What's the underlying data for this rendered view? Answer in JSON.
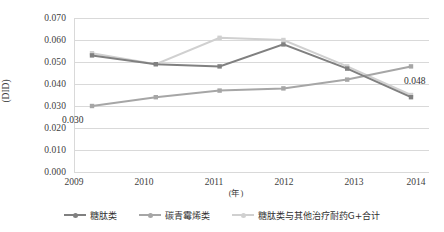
{
  "chart_data": {
    "type": "line",
    "title": "",
    "xlabel": "(年)",
    "ylabel": "(DID)",
    "categories": [
      "2009",
      "2010",
      "2011",
      "2012",
      "2013",
      "2014"
    ],
    "ylim": [
      0.0,
      0.07
    ],
    "yticks": [
      "0.000",
      "0.010",
      "0.020",
      "0.030",
      "0.040",
      "0.050",
      "0.060",
      "0.070"
    ],
    "ytick_values": [
      0.0,
      0.01,
      0.02,
      0.03,
      0.04,
      0.05,
      0.06,
      0.07
    ],
    "grid": true,
    "legend_position": "bottom",
    "series": [
      {
        "name": "糖肽类",
        "color": "#808080",
        "values": [
          0.053,
          0.049,
          0.048,
          0.058,
          0.047,
          0.034
        ]
      },
      {
        "name": "碳青霉烯类",
        "color": "#a6a6a6",
        "values": [
          0.03,
          0.034,
          0.037,
          0.038,
          0.042,
          0.048
        ]
      },
      {
        "name": "糖肽类与其他治疗耐药G+合计",
        "color": "#d0d0d0",
        "values": [
          0.054,
          0.049,
          0.061,
          0.06,
          0.048,
          0.035
        ]
      }
    ],
    "annotations": [
      {
        "text": "0.030",
        "series": "碳青霉烯类",
        "category": "2009",
        "value": 0.03
      },
      {
        "text": "0.048",
        "series": "碳青霉烯类",
        "category": "2014",
        "value": 0.048
      }
    ]
  }
}
